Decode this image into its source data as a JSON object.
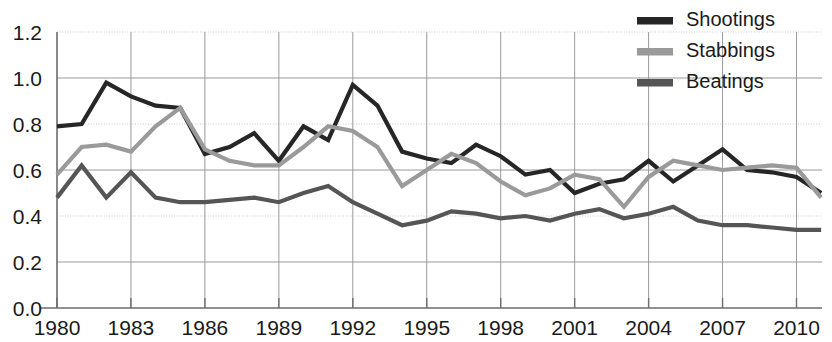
{
  "chart_data": {
    "type": "line",
    "title": "",
    "subtitle": "",
    "xlabel": "",
    "ylabel": "",
    "grid": true,
    "legend_position": "top-right",
    "xlim": [
      1980,
      2011
    ],
    "ylim": [
      0.0,
      1.2
    ],
    "x_tick_labels": [
      "1980",
      "1983",
      "1986",
      "1989",
      "1992",
      "1995",
      "1998",
      "2001",
      "2004",
      "2007",
      "2010"
    ],
    "x_tick_values": [
      1980,
      1983,
      1986,
      1989,
      1992,
      1995,
      1998,
      2001,
      2004,
      2007,
      2010
    ],
    "y_tick_labels": [
      "0.0",
      "0.2",
      "0.4",
      "0.6",
      "0.8",
      "1.0",
      "1.2"
    ],
    "y_tick_values": [
      0.0,
      0.2,
      0.4,
      0.6,
      0.8,
      1.0,
      1.2
    ],
    "x": [
      1980,
      1981,
      1982,
      1983,
      1984,
      1985,
      1986,
      1987,
      1988,
      1989,
      1990,
      1991,
      1992,
      1993,
      1994,
      1995,
      1996,
      1997,
      1998,
      1999,
      2000,
      2001,
      2002,
      2003,
      2004,
      2005,
      2006,
      2007,
      2008,
      2009,
      2010,
      2011
    ],
    "series": [
      {
        "name": "Shootings",
        "color": "#262626",
        "values": [
          0.79,
          0.8,
          0.98,
          0.92,
          0.88,
          0.87,
          0.67,
          0.7,
          0.76,
          0.64,
          0.79,
          0.73,
          0.97,
          0.88,
          0.68,
          0.65,
          0.63,
          0.71,
          0.66,
          0.58,
          0.6,
          0.5,
          0.54,
          0.56,
          0.64,
          0.55,
          0.62,
          0.69,
          0.6,
          0.59,
          0.57,
          0.5
        ]
      },
      {
        "name": "Stabbings",
        "color": "#9a9a9a",
        "values": [
          0.58,
          0.7,
          0.71,
          0.68,
          0.79,
          0.87,
          0.69,
          0.64,
          0.62,
          0.62,
          0.7,
          0.79,
          0.77,
          0.7,
          0.53,
          0.6,
          0.67,
          0.63,
          0.55,
          0.49,
          0.52,
          0.58,
          0.56,
          0.44,
          0.57,
          0.64,
          0.62,
          0.6,
          0.61,
          0.62,
          0.61,
          0.48
        ]
      },
      {
        "name": "Beatings",
        "color": "#555555",
        "values": [
          0.48,
          0.62,
          0.48,
          0.59,
          0.48,
          0.46,
          0.46,
          0.47,
          0.48,
          0.46,
          0.5,
          0.53,
          0.46,
          0.41,
          0.36,
          0.38,
          0.42,
          0.41,
          0.39,
          0.4,
          0.38,
          0.41,
          0.43,
          0.39,
          0.41,
          0.44,
          0.38,
          0.36,
          0.36,
          0.35,
          0.34,
          0.34
        ]
      }
    ]
  },
  "legend": {
    "items": [
      {
        "label": "Shootings",
        "color": "#262626"
      },
      {
        "label": "Stabbings",
        "color": "#9a9a9a"
      },
      {
        "label": "Beatings",
        "color": "#555555"
      }
    ]
  }
}
